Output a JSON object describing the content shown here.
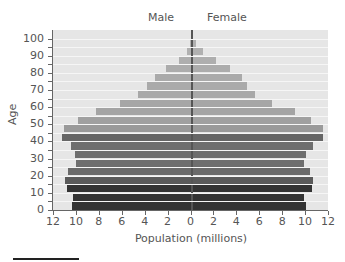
{
  "chart_data": {
    "type": "bar",
    "subtype": "population-pyramid",
    "title": "",
    "xlabel": "Population (millions)",
    "ylabel": "Age",
    "side_labels": {
      "left": "Male",
      "right": "Female"
    },
    "xlim": [
      -12,
      12
    ],
    "ylim": [
      0,
      105
    ],
    "x_ticks": [
      "12",
      "10",
      "8",
      "6",
      "4",
      "2",
      "0",
      "2",
      "4",
      "6",
      "8",
      "10",
      "12"
    ],
    "y_ticks": [
      "0",
      "10",
      "20",
      "30",
      "40",
      "50",
      "60",
      "70",
      "80",
      "90",
      "100"
    ],
    "categories": [
      "0-4",
      "5-9",
      "10-14",
      "15-19",
      "20-24",
      "25-29",
      "30-34",
      "35-39",
      "40-44",
      "45-49",
      "50-54",
      "55-59",
      "60-64",
      "65-69",
      "70-74",
      "75-79",
      "80-84",
      "85-89",
      "90-94",
      "95-99"
    ],
    "series": [
      {
        "name": "Male",
        "values": [
          10.4,
          10.3,
          10.9,
          11.0,
          10.8,
          10.1,
          10.2,
          10.5,
          11.3,
          11.1,
          9.9,
          8.3,
          6.2,
          4.7,
          3.9,
          3.2,
          2.2,
          1.1,
          0.35,
          0.1
        ]
      },
      {
        "name": "Female",
        "values": [
          10.0,
          9.8,
          10.5,
          10.6,
          10.3,
          9.8,
          10.0,
          10.6,
          11.5,
          11.5,
          10.4,
          9.0,
          7.0,
          5.5,
          4.8,
          4.4,
          3.4,
          2.1,
          1.0,
          0.4
        ]
      }
    ],
    "band_shades": [
      "#333333",
      "#333333",
      "#333333",
      "#5a5a5a",
      "#6a6a6a",
      "#6e6e6e",
      "#6e6e6e",
      "#6e6e6e",
      "#666666",
      "#9a9a9a",
      "#a0a0a0",
      "#a4a4a4",
      "#a6a6a6",
      "#a8a8a8",
      "#aaaaaa",
      "#aaaaaa",
      "#acacac",
      "#aeaeae",
      "#b0b0b0",
      "#b0b0b0"
    ],
    "background": "#e6e6e6",
    "grid": false,
    "legend": "none"
  }
}
